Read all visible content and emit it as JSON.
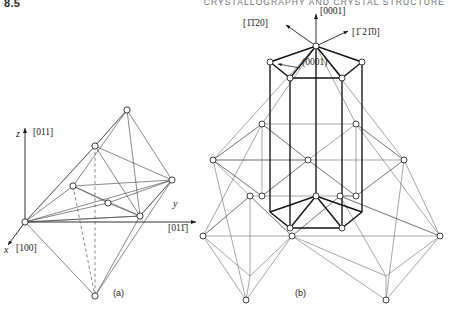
{
  "header": {
    "folio": "8.5",
    "running_head": "CRYSTALLOGRAPHY AND CRYSTAL STRUCTURE"
  },
  "figure": {
    "captions": {
      "a": "(a)",
      "b": "(b)"
    },
    "panel_a": {
      "name": "cubic-octahedral-lattice",
      "axes": [
        {
          "symbol": "z",
          "index": "[011]"
        },
        {
          "symbol": "y",
          "index": "[011̄]"
        },
        {
          "symbol": "x",
          "index": "[100]"
        }
      ]
    },
    "panel_b": {
      "name": "hexagonal-prism-lattice",
      "directions": [
        {
          "index": "[0001]"
        },
        {
          "index": "[1̄1̄20]"
        },
        {
          "index": "[1̄ 21̄0]"
        }
      ],
      "planes": [
        {
          "index": "(0001)"
        }
      ]
    }
  },
  "colors": {
    "ink": "#1a1a1a",
    "light_ink": "#6b6b6b",
    "paper": "#ffffff",
    "node_fill": "#ffffff"
  }
}
